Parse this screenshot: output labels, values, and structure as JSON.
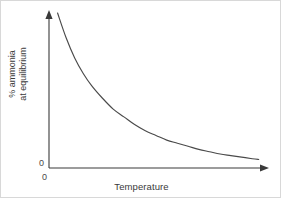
{
  "figure": {
    "background_color": "#ffffff",
    "border_color": "#d8d8d8",
    "axis_color": "#3a3a3a",
    "curve_color": "#4a4a4a"
  },
  "axes": {
    "y_origin_label": "0",
    "x_origin_label": "0",
    "y_label_line1": "% ammonia",
    "y_label_line2": "at equilibrium",
    "x_label": "Temperature"
  },
  "chart_data": {
    "type": "line",
    "title": "",
    "subtitle": "",
    "xlabel": "Temperature",
    "ylabel": "% ammonia at equilibrium",
    "xlim": [
      0,
      100
    ],
    "ylim": [
      0,
      100
    ],
    "grid": false,
    "legend": false,
    "legend_position": "none",
    "xticks": [
      "0"
    ],
    "yticks": [
      "0"
    ],
    "axis_arrows": {
      "x": "right",
      "y": "up"
    },
    "annotations": [],
    "series": [
      {
        "name": "% ammonia at equilibrium",
        "x": [
          4,
          8,
          12,
          16,
          20,
          25,
          30,
          35,
          40,
          45,
          50,
          55,
          60,
          65,
          70,
          75,
          80,
          85,
          90,
          95,
          98
        ],
        "y": [
          100,
          84,
          71,
          61,
          53,
          45,
          38,
          33,
          28,
          24,
          21,
          18,
          16,
          14,
          12,
          10.5,
          9,
          8,
          7,
          6,
          5.5
        ]
      }
    ]
  }
}
